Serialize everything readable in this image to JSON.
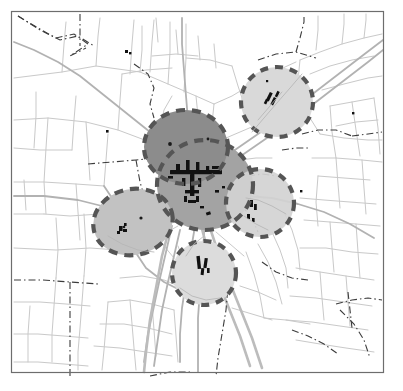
{
  "figure": {
    "type": "thematic-map",
    "title": "",
    "width": 403,
    "height": 391,
    "background_color": "#ffffff",
    "frame": {
      "x": 11,
      "y": 11,
      "width": 372,
      "height": 361,
      "stroke_color": "#6d6d6d",
      "stroke_width": 1.2
    }
  },
  "palette": {
    "road_minor": "#c9c9c9",
    "road_major": "#b4b4b4",
    "road_motorway": "#bdbdbd",
    "boundary_dashdot": "#3c3c3c",
    "built_up_black": "#111111",
    "catchment_dark_fill": "#8c8c8c",
    "catchment_mid_fill": "#a3a3a3",
    "catchment_light_fill": "#d9d9d9",
    "catchment_outline": "#555555",
    "frame": "#6d6d6d"
  },
  "catchments": [
    {
      "id": "core-primary",
      "label": "Central core catchment",
      "shape": "ellipse",
      "cx": 186,
      "cy": 147,
      "rx": 42,
      "ry": 37,
      "fill": "#8c8c8c",
      "fill_opacity": 1,
      "outline_color": "#555555",
      "outline_width": 4.2,
      "dash_pattern": "9 7",
      "z": 2
    },
    {
      "id": "core-secondary",
      "label": "Central outer catchment",
      "shape": "ellipse",
      "cx": 205,
      "cy": 185,
      "rx": 48,
      "ry": 45,
      "fill": "#a3a3a3",
      "fill_opacity": 1,
      "outline_color": "#555555",
      "outline_width": 4.2,
      "dash_pattern": "9 7",
      "z": 1
    },
    {
      "id": "north-east",
      "label": "North-east catchment",
      "shape": "ellipse",
      "cx": 277,
      "cy": 102,
      "rx": 36,
      "ry": 35,
      "fill": "#d9d9d9",
      "fill_opacity": 1,
      "outline_color": "#555555",
      "outline_width": 4.2,
      "dash_pattern": "8 7",
      "z": 3
    },
    {
      "id": "west",
      "label": "West catchment",
      "shape": "ellipse",
      "cx": 133,
      "cy": 222,
      "rx": 40,
      "ry": 33,
      "rotate": -12,
      "fill": "#c2c2c2",
      "fill_opacity": 1,
      "outline_color": "#555555",
      "outline_width": 4.2,
      "dash_pattern": "9 7",
      "z": 3
    },
    {
      "id": "east",
      "label": "East catchment",
      "shape": "ellipse",
      "cx": 260,
      "cy": 203,
      "rx": 34,
      "ry": 34,
      "fill": "#d2d2d2",
      "fill_opacity": 1,
      "outline_color": "#555555",
      "outline_width": 4.2,
      "dash_pattern": "8 7",
      "z": 3
    },
    {
      "id": "south",
      "label": "South catchment",
      "shape": "ellipse",
      "cx": 204,
      "cy": 273,
      "rx": 32,
      "ry": 32,
      "fill": "#dcdcdc",
      "fill_opacity": 1,
      "outline_color": "#555555",
      "outline_width": 4.2,
      "dash_pattern": "8 7",
      "z": 3
    }
  ],
  "settlement_markers": [
    {
      "id": "core-town-centre",
      "label": "Town centre built-up area",
      "cx": 196,
      "cy": 178
    },
    {
      "id": "ne-village",
      "label": "North-east village",
      "cx": 272,
      "cy": 98
    },
    {
      "id": "w-village",
      "label": "West village",
      "cx": 122,
      "cy": 228
    },
    {
      "id": "s-village",
      "label": "South village",
      "cx": 202,
      "cy": 264
    },
    {
      "id": "e-village",
      "label": "East village",
      "cx": 253,
      "cy": 208
    }
  ],
  "point_features": [
    {
      "id": "pt-a",
      "cx": 170,
      "cy": 144
    },
    {
      "id": "pt-b",
      "cx": 208,
      "cy": 139
    },
    {
      "id": "pt-c",
      "cx": 141,
      "cy": 218
    },
    {
      "id": "pt-d",
      "cx": 124,
      "cy": 227
    }
  ],
  "chart_data": {
    "type": "map",
    "title": "",
    "legend": [],
    "series": [
      {
        "name": "Central core catchment",
        "fill": "#8c8c8c",
        "radius_px": 40
      },
      {
        "name": "Central outer catchment",
        "fill": "#a3a3a3",
        "radius_px": 47
      },
      {
        "name": "North-east catchment",
        "fill": "#d9d9d9",
        "radius_px": 35
      },
      {
        "name": "West catchment",
        "fill": "#c2c2c2",
        "radius_px": 37
      },
      {
        "name": "East catchment",
        "fill": "#d2d2d2",
        "radius_px": 34
      },
      {
        "name": "South catchment",
        "fill": "#dcdcdc",
        "radius_px": 32
      }
    ]
  }
}
